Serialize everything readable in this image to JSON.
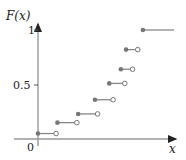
{
  "chart_data": {
    "type": "line",
    "subtype": "step-cdf",
    "title": "",
    "ylabel": "F(x)",
    "xlabel": "x",
    "ytick_labels": [
      "0",
      "0.5",
      "1"
    ],
    "yticks": [
      0,
      0.5,
      1
    ],
    "ylim": [
      0,
      1.05
    ],
    "grid": false,
    "legend": null,
    "steps": [
      {
        "x_start": 0.0,
        "x_end": 0.14,
        "y": 0.05
      },
      {
        "x_start": 0.15,
        "x_end": 0.3,
        "y": 0.15
      },
      {
        "x_start": 0.31,
        "x_end": 0.46,
        "y": 0.23
      },
      {
        "x_start": 0.44,
        "x_end": 0.58,
        "y": 0.36
      },
      {
        "x_start": 0.55,
        "x_end": 0.67,
        "y": 0.51
      },
      {
        "x_start": 0.64,
        "x_end": 0.73,
        "y": 0.64
      },
      {
        "x_start": 0.68,
        "x_end": 0.77,
        "y": 0.82
      },
      {
        "x_start": 0.81,
        "x_end": 1.05,
        "y": 1.0,
        "open_end": false
      }
    ],
    "colors": {
      "axis": "#999999",
      "step": "#888888",
      "closed_dot": "#777777",
      "open_dot": "#ffffff"
    }
  },
  "labels": {
    "y_axis": "F(x)",
    "x_axis": "x",
    "origin": "0",
    "tick_half": "0.5",
    "tick_one": "1"
  }
}
